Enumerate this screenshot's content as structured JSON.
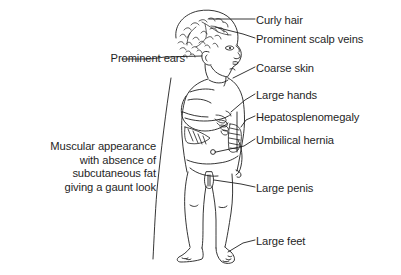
{
  "diagram": {
    "background_color": "#ffffff",
    "ink_color": "#1f1f1f",
    "labels_right": [
      {
        "id": "curly-hair",
        "text": "Curly hair",
        "top": 14
      },
      {
        "id": "prominent-scalp-veins",
        "text": "Prominent scalp veins",
        "top": 33
      },
      {
        "id": "coarse-skin",
        "text": "Coarse skin",
        "top": 62
      },
      {
        "id": "large-hands",
        "text": "Large hands",
        "top": 89
      },
      {
        "id": "hepatosplenomegaly",
        "text": "Hepatosplenomegaly",
        "top": 111
      },
      {
        "id": "umbilical-hernia",
        "text": "Umbilical hernia",
        "top": 134
      },
      {
        "id": "large-penis",
        "text": "Large penis",
        "top": 182
      },
      {
        "id": "large-feet",
        "text": "Large feet",
        "top": 235
      }
    ],
    "labels_left": {
      "prominent_ears": "Prominent ears",
      "gaunt_block": [
        "Muscular appearance",
        "with absence of",
        "subcutaneous fat",
        "giving a gaunt look"
      ]
    }
  }
}
